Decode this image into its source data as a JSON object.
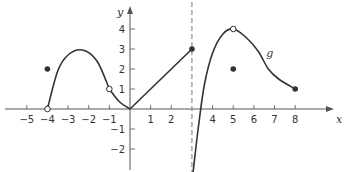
{
  "chart_data": {
    "type": "line",
    "title": "",
    "xlabel": "x",
    "ylabel": "y",
    "function_label": "g",
    "xlim": [
      -5.8,
      9.4
    ],
    "ylim": [
      -3.3,
      4.6
    ],
    "grid": false,
    "x_ticks": [
      -5,
      -4,
      -3,
      -2,
      -1,
      1,
      2,
      4,
      5,
      6,
      7,
      8
    ],
    "y_ticks": [
      4,
      3,
      2,
      1,
      -1,
      -2
    ],
    "vertical_asymptote": {
      "x": 3,
      "style": "dashed"
    },
    "segments": [
      {
        "name": "hump",
        "x_from": -4,
        "x_to": -1,
        "points": [
          [
            -4,
            0
          ],
          [
            -3.5,
            1.9
          ],
          [
            -3,
            2.7
          ],
          [
            -2.3,
            2.95
          ],
          [
            -1.6,
            2.4
          ],
          [
            -1,
            1
          ]
        ]
      },
      {
        "name": "dip",
        "x_from": -1,
        "x_to": 0,
        "points": [
          [
            -1,
            1
          ],
          [
            -0.5,
            0.35
          ],
          [
            0,
            0
          ]
        ]
      },
      {
        "name": "linear",
        "x_from": 0,
        "x_to": 3,
        "points": [
          [
            0,
            0
          ],
          [
            3,
            3
          ]
        ]
      },
      {
        "name": "right-branch",
        "x_from": 3.05,
        "x_to": 8,
        "points": [
          [
            3.05,
            -3.2
          ],
          [
            3.3,
            -1
          ],
          [
            3.6,
            1.2
          ],
          [
            4,
            2.8
          ],
          [
            4.5,
            3.75
          ],
          [
            5,
            4
          ],
          [
            5.6,
            3.6
          ],
          [
            6.2,
            2.9
          ],
          [
            6.7,
            2
          ],
          [
            7.2,
            1.5
          ],
          [
            8,
            1
          ]
        ]
      }
    ],
    "open_points": [
      [
        -4,
        0
      ],
      [
        -1,
        1
      ],
      [
        5,
        4
      ]
    ],
    "closed_points": [
      [
        -4,
        2
      ],
      [
        3,
        3
      ],
      [
        5,
        2
      ],
      [
        8,
        1
      ]
    ],
    "annotations": [
      {
        "text": "g",
        "x": 6.6,
        "y": 2.6
      }
    ]
  },
  "axes": {
    "x_label": "x",
    "y_label": "y",
    "x_tick_labels": [
      "−5",
      "−4",
      "−3",
      "−2",
      "−1",
      "1",
      "2",
      "4",
      "5",
      "6",
      "7",
      "8"
    ],
    "y_tick_labels": [
      "4",
      "3",
      "2",
      "1",
      "−1",
      "−2"
    ]
  },
  "colors": {
    "curve": "#333333",
    "axis": "#555555",
    "background": "#ffffff"
  }
}
